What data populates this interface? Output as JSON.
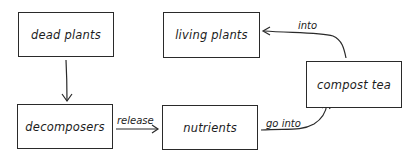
{
  "diagram": {
    "nodes": [
      {
        "id": "dead_plants",
        "label": "dead plants",
        "x": 18,
        "y": 12,
        "w": 96,
        "h": 45
      },
      {
        "id": "living_plants",
        "label": "living plants",
        "x": 163,
        "y": 12,
        "w": 97,
        "h": 46
      },
      {
        "id": "compost_tea",
        "label": "compost tea",
        "x": 306,
        "y": 61,
        "w": 96,
        "h": 47
      },
      {
        "id": "decomposers",
        "label": "decomposers",
        "x": 17,
        "y": 104,
        "w": 96,
        "h": 45
      },
      {
        "id": "nutrients",
        "label": "nutrients",
        "x": 162,
        "y": 105,
        "w": 96,
        "h": 45
      }
    ],
    "edges": [
      {
        "from": "dead_plants",
        "to": "decomposers",
        "label": ""
      },
      {
        "from": "decomposers",
        "to": "nutrients",
        "label": "release"
      },
      {
        "from": "nutrients",
        "to": "compost_tea",
        "label": "go into"
      },
      {
        "from": "compost_tea",
        "to": "living_plants",
        "label": "into"
      }
    ],
    "colors": {
      "stroke": "#2a2a2a",
      "background": "#ffffff"
    }
  }
}
